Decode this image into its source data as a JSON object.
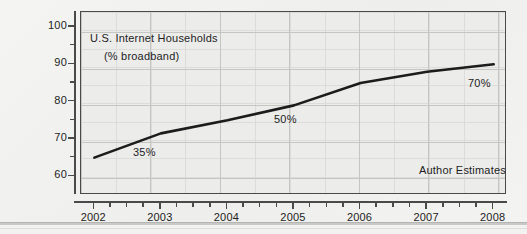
{
  "chart_data": {
    "type": "line",
    "title": "U.S. Internet Households",
    "subtitle": "(% broadband)",
    "xlabel": "",
    "ylabel": "",
    "x": [
      2002,
      2003,
      2004,
      2005,
      2006,
      2007,
      2008
    ],
    "categories": [
      "2002",
      "2003",
      "2004",
      "2005",
      "2006",
      "2007",
      "2008"
    ],
    "values": [
      65,
      71.5,
      75,
      79,
      85,
      88,
      90
    ],
    "series": [
      {
        "name": "U.S. Internet Households",
        "values": [
          65,
          71.5,
          75,
          79,
          85,
          88,
          90
        ]
      }
    ],
    "ylim": [
      55,
      104
    ],
    "xlim": [
      2001.8,
      2008.2
    ],
    "y_ticks": [
      60,
      70,
      80,
      90,
      100
    ],
    "y_tick_labels": [
      "60",
      "70",
      "80",
      "90",
      "100"
    ],
    "y_minor_ticks": [
      65,
      75,
      85,
      95
    ],
    "x_ticks": [
      2002,
      2003,
      2004,
      2005,
      2006,
      2007,
      2008
    ],
    "x_tick_labels": [
      "2002",
      "2003",
      "2004",
      "2005",
      "2006",
      "2007",
      "2008"
    ],
    "grid": true,
    "legend": "none",
    "annotations": [
      {
        "text": "U.S. Internet Households",
        "x": 2002.3,
        "y": 96
      },
      {
        "text": "(% broadband)",
        "x": 2002.5,
        "y": 91
      },
      {
        "text": "35%",
        "x": 2003.0,
        "y": 66.5
      },
      {
        "text": "50%",
        "x": 2005.0,
        "y": 75.5
      },
      {
        "text": "70%",
        "x": 2008.0,
        "y": 85.5
      },
      {
        "text": "Author Estimates",
        "x": 2007.3,
        "y": 61.5
      }
    ],
    "colors": {
      "line": "#1c1c1c",
      "plot_background": "#ececeb",
      "page_background": "#f2f2f1",
      "grid_major": "#c5c5c2",
      "grid_minor": "#dcdcda",
      "axis": "#4a4a4a",
      "text": "#1d1d1d"
    }
  },
  "annotations": {
    "title_line1": "U.S. Internet Households",
    "title_line2": "(% broadband)",
    "point_35": "35%",
    "point_50": "50%",
    "point_70": "70%",
    "source_note": "Author Estimates"
  },
  "axes": {
    "y_labels": [
      "100",
      "90",
      "80",
      "70",
      "60"
    ],
    "x_labels": [
      "2002",
      "2003",
      "2004",
      "2005",
      "2006",
      "2007",
      "2008"
    ]
  }
}
